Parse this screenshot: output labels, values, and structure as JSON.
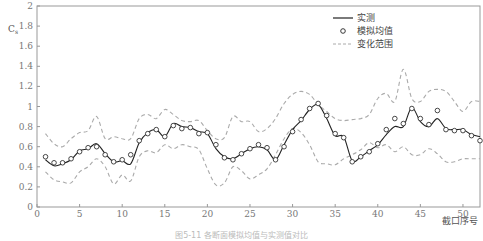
{
  "figure": {
    "caption": "图5-11 各断面模拟均值与实测值对比"
  },
  "chart_data": {
    "type": "line",
    "title": "",
    "xlabel": "截口序号",
    "ylabel": "C_s",
    "xlim": [
      0,
      52
    ],
    "ylim": [
      0,
      2
    ],
    "xticks": [
      0,
      5,
      10,
      15,
      20,
      25,
      30,
      35,
      40,
      45,
      50
    ],
    "yticks": [
      0,
      0.2,
      0.4,
      0.6,
      0.8,
      1,
      1.2,
      1.4,
      1.6,
      1.8,
      2
    ],
    "ytick_labels": [
      "0",
      "0.2",
      "0.4",
      "0.6",
      "0.8",
      "1",
      "1.2",
      "1.4",
      "1.6",
      "1.8",
      "2"
    ],
    "grid": false,
    "legend_position": "upper right",
    "legend": [
      {
        "label": "实测",
        "style": "solid-line",
        "color": "#222222"
      },
      {
        "label": "模拟均值",
        "style": "circle-marker",
        "color": "#222222"
      },
      {
        "label": "变化范围",
        "style": "dashed-line",
        "color": "#aaaaaa"
      }
    ],
    "x": [
      1,
      2,
      3,
      4,
      5,
      6,
      7,
      8,
      9,
      10,
      11,
      12,
      13,
      14,
      15,
      16,
      17,
      18,
      19,
      20,
      21,
      22,
      23,
      24,
      25,
      26,
      27,
      28,
      29,
      30,
      31,
      32,
      33,
      34,
      35,
      36,
      37,
      38,
      39,
      40,
      41,
      42,
      43,
      44,
      45,
      46,
      47,
      48,
      49,
      50,
      51,
      52
    ],
    "series": [
      {
        "name": "实测",
        "values": [
          0.47,
          0.41,
          0.43,
          0.47,
          0.56,
          0.58,
          0.63,
          0.53,
          0.45,
          0.46,
          0.43,
          0.64,
          0.74,
          0.77,
          0.7,
          0.83,
          0.8,
          0.79,
          0.75,
          0.73,
          0.58,
          0.5,
          0.48,
          0.53,
          0.58,
          0.6,
          0.57,
          0.47,
          0.62,
          0.77,
          0.86,
          0.97,
          1.02,
          0.88,
          0.71,
          0.7,
          0.46,
          0.5,
          0.56,
          0.62,
          0.72,
          0.8,
          0.8,
          0.99,
          0.85,
          0.8,
          0.88,
          0.78,
          0.77,
          0.77,
          0.72,
          0.7
        ]
      },
      {
        "name": "模拟均值",
        "values": [
          0.5,
          0.44,
          0.44,
          0.48,
          0.55,
          0.59,
          0.6,
          0.52,
          0.45,
          0.47,
          0.52,
          0.66,
          0.73,
          0.77,
          0.7,
          0.81,
          0.78,
          0.79,
          0.73,
          0.74,
          0.62,
          0.49,
          0.47,
          0.53,
          0.58,
          0.62,
          0.59,
          0.47,
          0.6,
          0.75,
          0.87,
          0.98,
          1.03,
          0.91,
          0.73,
          0.69,
          0.45,
          0.5,
          0.55,
          0.63,
          0.77,
          0.88,
          0.83,
          0.98,
          0.88,
          0.82,
          0.96,
          0.77,
          0.76,
          0.76,
          0.71,
          0.66
        ]
      },
      {
        "name": "变化范围-上限",
        "values": [
          0.73,
          0.63,
          0.6,
          0.68,
          0.74,
          0.76,
          0.9,
          0.68,
          0.7,
          0.68,
          0.68,
          0.88,
          0.92,
          0.88,
          0.97,
          0.92,
          0.86,
          0.85,
          0.86,
          0.76,
          0.68,
          0.69,
          0.9,
          0.85,
          0.85,
          0.75,
          0.78,
          0.88,
          1.03,
          1.12,
          1.15,
          1.12,
          1.02,
          0.95,
          0.88,
          0.86,
          0.87,
          0.88,
          0.92,
          1.08,
          1.13,
          1.05,
          1.37,
          1.08,
          1.05,
          1.15,
          1.17,
          1.15,
          1.05,
          0.95,
          1.05,
          1.05
        ]
      },
      {
        "name": "变化范围-下限",
        "values": [
          0.35,
          0.27,
          0.25,
          0.24,
          0.35,
          0.4,
          0.48,
          0.4,
          0.23,
          0.32,
          0.26,
          0.5,
          0.56,
          0.54,
          0.62,
          0.58,
          0.62,
          0.6,
          0.57,
          0.38,
          0.22,
          0.24,
          0.4,
          0.36,
          0.28,
          0.32,
          0.38,
          0.52,
          0.68,
          0.78,
          0.74,
          0.62,
          0.45,
          0.43,
          0.42,
          0.48,
          0.52,
          0.57,
          0.64,
          0.59,
          0.62,
          0.55,
          0.6,
          0.52,
          0.52,
          0.58,
          0.53,
          0.45,
          0.45,
          0.48,
          0.48,
          0.48
        ]
      }
    ]
  }
}
